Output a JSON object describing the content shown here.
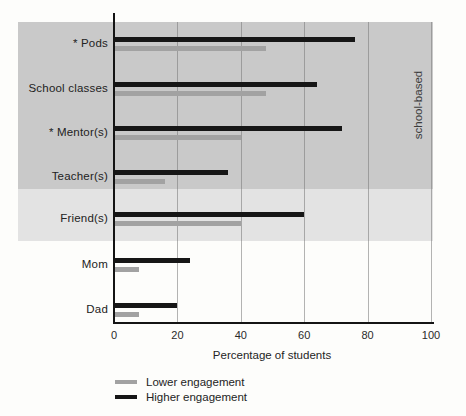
{
  "figure": {
    "xlabel": "Percentage of students",
    "band_label": "school-based"
  },
  "chart_data": {
    "type": "bar",
    "orientation": "horizontal",
    "title": "",
    "xlabel": "Percentage of students",
    "xlim": [
      0,
      100
    ],
    "xticks": [
      0,
      20,
      40,
      60,
      80,
      100
    ],
    "grid": true,
    "categories": [
      "* Pods",
      "School classes",
      "* Mentor(s)",
      "Teacher(s)",
      "Friend(s)",
      "Mom",
      "Dad"
    ],
    "series": [
      {
        "name": "Higher engagement",
        "color": "#161616",
        "values": [
          76,
          64,
          72,
          36,
          60,
          24,
          20
        ]
      },
      {
        "name": "Lower engagement",
        "color": "#a2a2a2",
        "values": [
          48,
          48,
          40,
          16,
          40,
          8,
          8
        ]
      }
    ],
    "legend_position": "bottom-left",
    "legend": [
      {
        "label": "Lower engagement",
        "color": "#a2a2a2"
      },
      {
        "label": "Higher engagement",
        "color": "#161616"
      }
    ],
    "annotations": [
      {
        "text": "school-based",
        "rotation": -90,
        "side": "right"
      }
    ],
    "bands": [
      {
        "name": "school-based",
        "color": "#c9c9c9",
        "covers": [
          "* Pods",
          "School classes",
          "* Mentor(s)",
          "Teacher(s)"
        ]
      },
      {
        "name": "friends-highlight",
        "color": "#e3e3e3",
        "covers": [
          "Friend(s)"
        ]
      }
    ],
    "colors": {
      "higher_engagement": "#161616",
      "lower_engagement": "#a2a2a2",
      "band_dark": "#c9c9c9",
      "band_light": "#e3e3e3",
      "gridline": "#9a9a9a",
      "axis": "#141414"
    }
  }
}
